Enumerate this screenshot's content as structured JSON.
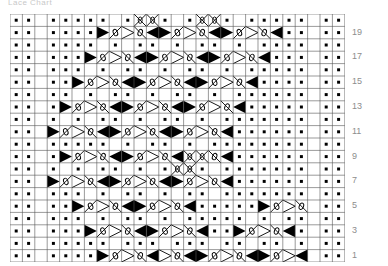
{
  "caption": {
    "text": "Lace Chart"
  },
  "chart": {
    "type": "knitting-chart",
    "columns": 27,
    "rows": 20,
    "cell_size": 12.4,
    "grid_color": "#555555",
    "background": "#ffffff",
    "symbol_color": "#000000",
    "row_numbers": [
      "19",
      "17",
      "15",
      "13",
      "11",
      "9",
      "7",
      "5",
      "3",
      "1"
    ],
    "row_number_rows": [
      2,
      4,
      6,
      8,
      10,
      12,
      14,
      16,
      18,
      20
    ],
    "legend_symbols": [
      {
        "key": "dot",
        "name": "purl-stitch-dot"
      },
      {
        "key": "tl",
        "name": "decrease-triangle-left"
      },
      {
        "key": "tr",
        "name": "decrease-triangle-right"
      },
      {
        "key": "dl",
        "name": "diagonal-down-left"
      },
      {
        "key": "dr",
        "name": "diagonal-down-right"
      },
      {
        "key": "x",
        "name": "cross-cable"
      },
      {
        "key": "ol",
        "name": "yarnover-loop-left"
      },
      {
        "key": "or",
        "name": "yarnover-loop-right"
      },
      {
        "key": "vl",
        "name": "vee-left"
      },
      {
        "key": "vr",
        "name": "vee-right"
      }
    ],
    "grid": [
      [
        "dot",
        "dot",
        "",
        "dot",
        "dot",
        "dot",
        "dot",
        "dot",
        "",
        "dot",
        "x",
        "x",
        "dot",
        "",
        "dot",
        "x",
        "x",
        "dot",
        "",
        "dot",
        "dot",
        "dot",
        "dot",
        "dot",
        "",
        "dot",
        "dot"
      ],
      [
        "dot",
        "dot",
        "",
        "dot",
        "dot",
        "dot",
        "dot",
        "tr",
        "ol",
        "vl",
        "or",
        "tl",
        "tr",
        "ol",
        "vl",
        "or",
        "tl",
        "tr",
        "ol",
        "vl",
        "or",
        "tl",
        "dot",
        "dot",
        "",
        "dot",
        "dot"
      ],
      [
        "dot",
        "dot",
        "",
        "dot",
        "dot",
        "dot",
        "dot",
        "",
        "dot",
        "",
        "dot",
        "dot",
        "",
        "dot",
        "",
        "dot",
        "dot",
        "",
        "dot",
        "",
        "dot",
        "dot",
        "dot",
        "dot",
        "",
        "dot",
        "dot"
      ],
      [
        "dot",
        "dot",
        "",
        "dot",
        "dot",
        "dot",
        "tr",
        "ol",
        "vl",
        "or",
        "tl",
        "tr",
        "ol",
        "vl",
        "or",
        "tl",
        "tr",
        "ol",
        "vl",
        "or",
        "tl",
        "dot",
        "dot",
        "dot",
        "",
        "dot",
        "dot"
      ],
      [
        "dot",
        "dot",
        "",
        "dot",
        "dot",
        "dot",
        "",
        "dot",
        "",
        "dot",
        "dot",
        "",
        "dot",
        "",
        "dot",
        "dot",
        "",
        "dot",
        "",
        "dot",
        "dot",
        "dot",
        "dot",
        "dot",
        "",
        "dot",
        "dot"
      ],
      [
        "dot",
        "dot",
        "",
        "dot",
        "dot",
        "tr",
        "ol",
        "vl",
        "or",
        "tl",
        "tr",
        "ol",
        "vl",
        "or",
        "tl",
        "tr",
        "ol",
        "vl",
        "or",
        "tl",
        "dot",
        "dot",
        "dot",
        "dot",
        "",
        "dot",
        "dot"
      ],
      [
        "dot",
        "dot",
        "",
        "dot",
        "dot",
        "",
        "dot",
        "",
        "dot",
        "dot",
        "",
        "dot",
        "",
        "dot",
        "dot",
        "",
        "dot",
        "",
        "dot",
        "dot",
        "dot",
        "dot",
        "dot",
        "dot",
        "",
        "dot",
        "dot"
      ],
      [
        "dot",
        "dot",
        "",
        "dot",
        "tr",
        "ol",
        "vl",
        "or",
        "tl",
        "tr",
        "ol",
        "vl",
        "or",
        "tl",
        "tr",
        "ol",
        "vl",
        "or",
        "tl",
        "dot",
        "dot",
        "dot",
        "dot",
        "dot",
        "",
        "dot",
        "dot"
      ],
      [
        "dot",
        "dot",
        "",
        "dot",
        "",
        "dot",
        "",
        "dot",
        "dot",
        "",
        "dot",
        "",
        "dot",
        "dot",
        "",
        "dot",
        "",
        "dot",
        "dot",
        "dot",
        "dot",
        "dot",
        "dot",
        "dot",
        "",
        "dot",
        "dot"
      ],
      [
        "dot",
        "dot",
        "",
        "tr",
        "ol",
        "vl",
        "or",
        "tl",
        "tr",
        "ol",
        "vl",
        "or",
        "tl",
        "tr",
        "ol",
        "vl",
        "or",
        "tl",
        "dot",
        "dot",
        "dot",
        "dot",
        "dot",
        "dot",
        "",
        "dot",
        "dot"
      ],
      [
        "dot",
        "dot",
        "",
        "dot",
        "dot",
        "dot",
        "dot",
        "dot",
        "",
        "dot",
        "",
        "dot",
        "dot",
        "",
        "dot",
        "",
        "dot",
        "dot",
        "dot",
        "dot",
        "dot",
        "dot",
        "dot",
        "dot",
        "",
        "dot",
        "dot"
      ],
      [
        "dot",
        "dot",
        "",
        "dot",
        "tr",
        "ol",
        "vl",
        "or",
        "tl",
        "tr",
        "ol",
        "vl",
        "or",
        "tl",
        "x",
        "x",
        "or",
        "tl",
        "dot",
        "dot",
        "dot",
        "dot",
        "dot",
        "dot",
        "",
        "dot",
        "dot"
      ],
      [
        "dot",
        "dot",
        "",
        "dot",
        "",
        "dot",
        "",
        "dot",
        "dot",
        "",
        "dot",
        "",
        "dot",
        "x",
        "x",
        "dot",
        "",
        "dot",
        "dot",
        "dot",
        "dot",
        "dot",
        "dot",
        "dot",
        "",
        "dot",
        "dot"
      ],
      [
        "dot",
        "dot",
        "",
        "tr",
        "ol",
        "vl",
        "or",
        "tl",
        "tr",
        "ol",
        "vl",
        "or",
        "tl",
        "tr",
        "ol",
        "vl",
        "or",
        "tl",
        "dot",
        "dot",
        "dot",
        "dot",
        "dot",
        "dot",
        "",
        "dot",
        "dot"
      ],
      [
        "dot",
        "dot",
        "",
        "dot",
        "dot",
        "dot",
        "",
        "dot",
        "",
        "dot",
        "dot",
        "",
        "dot",
        "",
        "dot",
        "dot",
        "",
        "dot",
        "dot",
        "dot",
        "dot",
        "dot",
        "dot",
        "dot",
        "",
        "dot",
        "dot"
      ],
      [
        "dot",
        "dot",
        "",
        "dot",
        "dot",
        "tr",
        "ol",
        "vl",
        "or",
        "tl",
        "tr",
        "ol",
        "vl",
        "or",
        "tl",
        "dot",
        "dot",
        "dot",
        "dot",
        "dot",
        "tr",
        "ol",
        "vl",
        "or",
        "",
        "dot",
        "dot"
      ],
      [
        "dot",
        "dot",
        "",
        "dot",
        "dot",
        "dot",
        "",
        "dot",
        "",
        "dot",
        "dot",
        "",
        "dot",
        "",
        "dot",
        "dot",
        "dot",
        "dot",
        "dot",
        "",
        "dot",
        "",
        "dot",
        "dot",
        "",
        "dot",
        "dot"
      ],
      [
        "dot",
        "dot",
        "",
        "dot",
        "dot",
        "dot",
        "tr",
        "ol",
        "vl",
        "or",
        "tl",
        "tr",
        "ol",
        "vl",
        "or",
        "tl",
        "dot",
        "dot",
        "tr",
        "ol",
        "vl",
        "or",
        "tl",
        "dot",
        "",
        "dot",
        "dot"
      ],
      [
        "dot",
        "dot",
        "",
        "dot",
        "dot",
        "dot",
        "dot",
        "dot",
        "",
        "dot",
        "dot",
        "dot",
        "",
        "dot",
        "dot",
        "dot",
        "",
        "dot",
        "dot",
        "",
        "dot",
        "dot",
        "",
        "dot",
        "",
        "dot",
        "dot"
      ],
      [
        "dot",
        "dot",
        "",
        "dot",
        "dot",
        "dot",
        "dot",
        "tr",
        "ol",
        "vl",
        "or",
        "tl",
        "vl",
        "or",
        "tl",
        "tr",
        "ol",
        "vl",
        "or",
        "tl",
        "tr",
        "ol",
        "vl",
        "tl",
        "",
        "dot",
        "dot"
      ]
    ]
  }
}
